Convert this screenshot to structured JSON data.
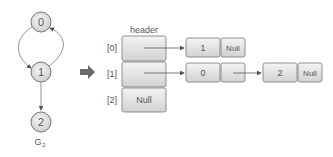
{
  "graph": {
    "name": "G",
    "subscript": "2",
    "nodes": [
      {
        "id": "0",
        "cx": 41,
        "cy": 22
      },
      {
        "id": "1",
        "cx": 41,
        "cy": 72
      },
      {
        "id": "2",
        "cx": 41,
        "cy": 122
      }
    ],
    "edges": [
      {
        "from": "0",
        "to": "1"
      },
      {
        "from": "1",
        "to": "0"
      },
      {
        "from": "1",
        "to": "2"
      }
    ]
  },
  "transform_arrow": "right-arrow",
  "adjacency_list": {
    "header_label": "header",
    "rows": [
      {
        "index": "[0]",
        "header_value": "",
        "nodes": [
          {
            "data": "1",
            "link": "Null"
          }
        ]
      },
      {
        "index": "[1]",
        "header_value": "",
        "nodes": [
          {
            "data": "0",
            "link": ""
          },
          {
            "data": "2",
            "link": "Null"
          }
        ]
      },
      {
        "index": "[2]",
        "header_value": "Null",
        "nodes": []
      }
    ]
  },
  "colors": {
    "box_fill_top": "#f2f2f2",
    "box_fill_bottom": "#d4d4d4",
    "stroke": "#777777",
    "text": "#555555",
    "arrow": "#6a6a6a"
  }
}
